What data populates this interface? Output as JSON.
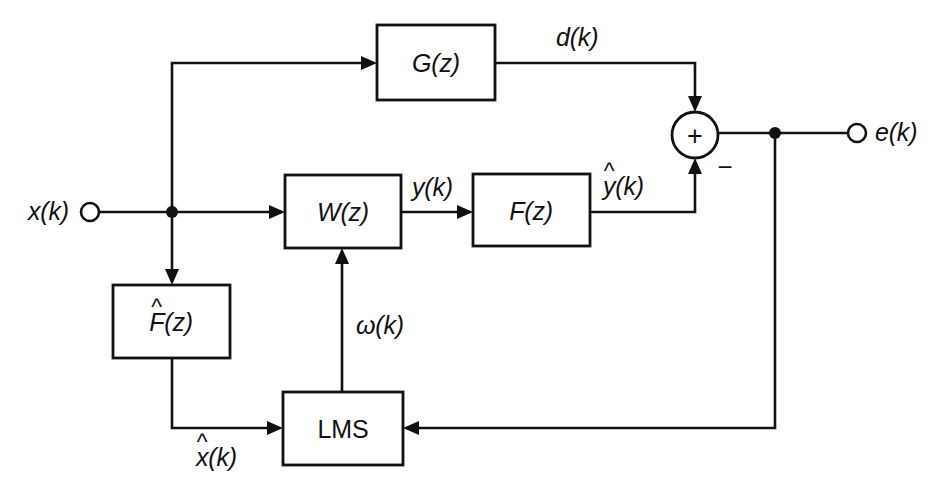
{
  "diagram": {
    "ink_color": "#111111",
    "background_color": "#ffffff",
    "blocks": [
      {
        "id": "gz",
        "label": "G(z)",
        "x": 377,
        "y": 25,
        "w": 118,
        "h": 75
      },
      {
        "id": "wz",
        "label": "W(z)",
        "x": 285,
        "y": 175,
        "w": 116,
        "h": 73
      },
      {
        "id": "fz",
        "label": "F(z)",
        "x": 473,
        "y": 174,
        "w": 117,
        "h": 72
      },
      {
        "id": "fhat",
        "label": "F(z)",
        "label_base": "F",
        "label_tail": "(z)",
        "accent": "^",
        "x": 113,
        "y": 285,
        "w": 117,
        "h": 73
      },
      {
        "id": "lms",
        "label": "LMS",
        "x": 283,
        "y": 392,
        "w": 120,
        "h": 73
      }
    ],
    "terminals": [
      {
        "id": "x-in",
        "label": "x(k)",
        "cx": 90,
        "cy": 212,
        "r": 9,
        "label_x": 28,
        "label_y": 212
      },
      {
        "id": "e-out",
        "label": "e(k)",
        "cx": 857,
        "cy": 133,
        "r": 9,
        "label_x": 875,
        "label_y": 133
      }
    ],
    "summer": {
      "id": "summing-junction",
      "cx": 695,
      "cy": 135,
      "r": 23,
      "plus_sign": "+",
      "minus_sign": "−",
      "minus_x": 725,
      "minus_y": 167
    },
    "junction_dots": [
      {
        "id": "x-branch-dot",
        "cx": 172,
        "cy": 212,
        "r": 6
      },
      {
        "id": "e-branch-dot",
        "cx": 775,
        "cy": 133,
        "r": 6
      }
    ],
    "signal_labels": [
      {
        "id": "d-signal",
        "text": "d(k)",
        "x": 556,
        "y": 38,
        "accent": null
      },
      {
        "id": "y-signal",
        "text": "y(k)",
        "x": 412,
        "y": 188,
        "accent": null
      },
      {
        "id": "yhat-signal",
        "text": "y(k)",
        "base": "y",
        "tail": "(k)",
        "x": 603,
        "y": 187,
        "accent": "^"
      },
      {
        "id": "omega-signal",
        "text": "ω(k)",
        "x": 356,
        "y": 326,
        "accent": null
      },
      {
        "id": "xhat-signal",
        "text": "x(k)",
        "base": "x",
        "tail": "(k)",
        "x": 196,
        "y": 458,
        "accent": "^"
      }
    ],
    "wire_paths": [
      {
        "id": "x-input-wire",
        "from": "x-in",
        "to": "x-branch-dot"
      },
      {
        "id": "x-to-wz-wire",
        "from": "x-branch-dot",
        "to": "wz"
      },
      {
        "id": "x-up-to-gz-wire",
        "from": "x-branch-dot",
        "to": "gz"
      },
      {
        "id": "x-down-to-fhat-wire",
        "from": "x-branch-dot",
        "to": "fhat"
      },
      {
        "id": "gz-to-summer-wire",
        "from": "gz",
        "to": "summing-junction",
        "signal": "d(k)"
      },
      {
        "id": "wz-to-fz-wire",
        "from": "wz",
        "to": "fz",
        "signal": "y(k)"
      },
      {
        "id": "fz-to-summer-wire",
        "from": "fz",
        "to": "summing-junction",
        "signal": "yhat(k)"
      },
      {
        "id": "summer-to-eout-wire",
        "from": "summing-junction",
        "to": "e-out"
      },
      {
        "id": "e-feedback-wire",
        "from": "e-branch-dot",
        "to": "lms"
      },
      {
        "id": "fhat-to-lms-wire",
        "from": "fhat",
        "to": "lms",
        "signal": "xhat(k)"
      },
      {
        "id": "lms-to-wz-wire",
        "from": "lms",
        "to": "wz",
        "signal": "omega(k)"
      }
    ]
  }
}
